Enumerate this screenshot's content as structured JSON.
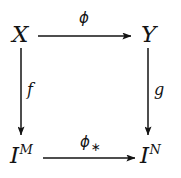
{
  "diagram": {
    "type": "commutative-square",
    "background_color": "#ffffff",
    "ink_color": "#131313",
    "nodes": [
      {
        "id": "top-left",
        "base": "X",
        "superscript": "",
        "x": 21,
        "y": 34
      },
      {
        "id": "top-right",
        "base": "Y",
        "superscript": "",
        "x": 150,
        "y": 34
      },
      {
        "id": "bottom-left",
        "base": "I",
        "superscript": "M",
        "x": 21,
        "y": 155
      },
      {
        "id": "bottom-right",
        "base": "I",
        "superscript": "N",
        "x": 150,
        "y": 155
      }
    ],
    "edges": [
      {
        "id": "top-edge",
        "from": "top-left",
        "to": "top-right",
        "direction": "right",
        "label_base": "ϕ",
        "label_sub": "",
        "label_position": "above",
        "x1": 38,
        "y1": 36,
        "x2": 133,
        "y2": 36
      },
      {
        "id": "bottom-edge",
        "from": "bottom-left",
        "to": "bottom-right",
        "direction": "right",
        "label_base": "ϕ",
        "label_sub": "∗",
        "label_position": "above",
        "x1": 43,
        "y1": 158,
        "x2": 137,
        "y2": 158
      },
      {
        "id": "left-edge",
        "from": "top-left",
        "to": "bottom-left",
        "direction": "down",
        "label_base": "f",
        "label_sub": "",
        "label_position": "right",
        "x1": 21,
        "y1": 48,
        "x2": 21,
        "y2": 137
      },
      {
        "id": "right-edge",
        "from": "top-right",
        "to": "bottom-right",
        "direction": "down",
        "label_base": "g",
        "label_sub": "",
        "label_position": "right",
        "x1": 148,
        "y1": 48,
        "x2": 148,
        "y2": 137
      }
    ]
  }
}
